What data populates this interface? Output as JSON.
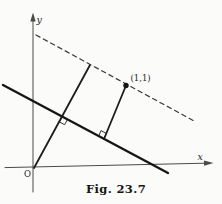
{
  "figure": {
    "caption": "Fig. 23.7",
    "background": "#fbfbf9",
    "ink": "#1c1c1c",
    "axis_color": "#4a4a4a",
    "canvas": {
      "width": 222,
      "height": 204
    },
    "segments": [
      {
        "name": "x-axis",
        "from": [
          5,
          167.6
        ],
        "to": [
          205,
          163.2
        ],
        "width": 1,
        "color": "#4a4a4a"
      },
      {
        "name": "y-axis",
        "from": [
          33,
          192
        ],
        "to": [
          33,
          17
        ],
        "width": 1,
        "color": "#4a4a4a"
      },
      {
        "name": "given-line",
        "from": [
          3,
          85
        ],
        "to": [
          168,
          173
        ],
        "width": 2.4,
        "color": "#161616"
      },
      {
        "name": "perpendicular-through-origin",
        "from": [
          34,
          168
        ],
        "to": [
          90,
          65
        ],
        "width": 1.8,
        "color": "#1d1d1d"
      },
      {
        "name": "perpendicular-from-point",
        "from": [
          126,
          85.5
        ],
        "to": [
          104,
          139
        ],
        "width": 1.8,
        "color": "#1d1d1d"
      },
      {
        "name": "parallel-dashed-line",
        "from": [
          36,
          35
        ],
        "to": [
          196,
          122
        ],
        "width": 1.2,
        "color": "#383838",
        "dash": "4.5 3.8"
      }
    ],
    "arrows": [
      {
        "name": "x-axis-arrowhead",
        "points": "213.5,163 203.9,160.6 204.1,165.8"
      },
      {
        "name": "y-axis-arrowhead",
        "points": "33,12.5 30.3,21.5 35.7,21.5"
      }
    ],
    "right_angles": [
      {
        "name": "right-angle-mark-at-origin-perpendicular",
        "points": "62.2,116.6 67.5,119.4 64.6,124.7 59.3,121.9"
      },
      {
        "name": "right-angle-mark-at-point-perpendicular",
        "points": "104,139 98.7,136.2 101,130.6 106.3,133.4"
      }
    ],
    "point": {
      "name": "point-1-1",
      "x": 126,
      "y": 85.5,
      "r": 2.7,
      "color": "#141414"
    },
    "text_labels": [
      {
        "name": "y-axis-label",
        "text": "y",
        "x": 36.5,
        "y": 23,
        "size": 9.5,
        "italic": true
      },
      {
        "name": "x-axis-label",
        "text": "x",
        "x": 197.5,
        "y": 159.5,
        "size": 9.5,
        "italic": true
      },
      {
        "name": "origin-label",
        "text": "O",
        "x": 24,
        "y": 177,
        "size": 8.5,
        "italic": false
      },
      {
        "name": "point-label",
        "text": "(1,1)",
        "x": 130.5,
        "y": 80.5,
        "size": 8.5,
        "italic": false
      }
    ]
  }
}
